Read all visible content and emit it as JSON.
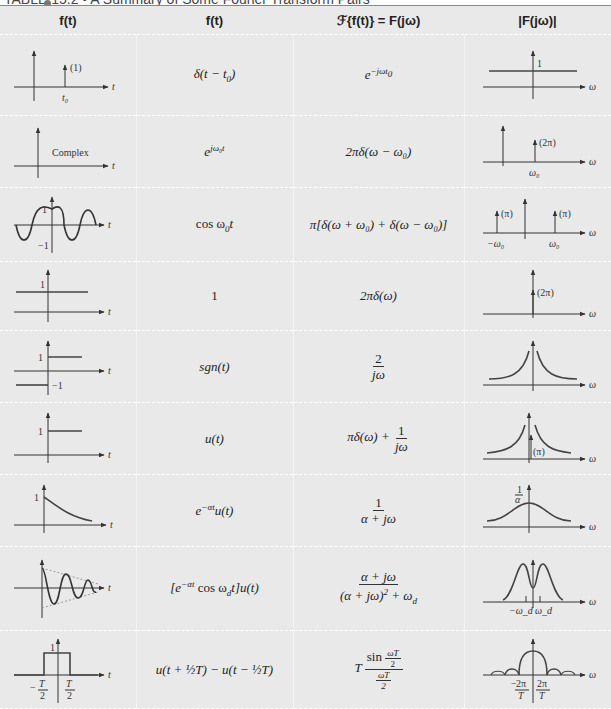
{
  "title": {
    "text": "TABLE 15.2  •  A Summary of Some Fourier Transform Pairs"
  },
  "headers": [
    "f(t)",
    "f(t)",
    "ℱ{f(t)} = F(jω)",
    "|F(jω)|"
  ],
  "rows": [
    {
      "name": "shifted-impulse",
      "ft": "δ(t − t₀)",
      "Fjw": "e^(−jωt₀)",
      "plot_t_labels": [
        "(1)",
        "t₀",
        "t"
      ],
      "plot_w_labels": [
        "1",
        "ω"
      ]
    },
    {
      "name": "complex-exponential",
      "ft": "e^(jω₀t)",
      "Fjw": "2πδ(ω − ω₀)",
      "plot_t_labels": [
        "Complex",
        "t"
      ],
      "plot_w_labels": [
        "(2π)",
        "ω₀",
        "ω"
      ]
    },
    {
      "name": "cosine",
      "ft": "cos ω₀t",
      "Fjw": "π[δ(ω + ω₀) + δ(ω − ω₀)]",
      "plot_t_labels": [
        "1",
        "−1",
        "t"
      ],
      "plot_w_labels": [
        "(π)",
        "(π)",
        "−ω₀",
        "ω₀",
        "ω"
      ]
    },
    {
      "name": "constant",
      "ft": "1",
      "Fjw": "2πδ(ω)",
      "plot_t_labels": [
        "1",
        "t"
      ],
      "plot_w_labels": [
        "(2π)",
        "ω"
      ]
    },
    {
      "name": "signum",
      "ft": "sgn(t)",
      "Fjw_num": "2",
      "Fjw_den": "jω",
      "plot_t_labels": [
        "1",
        "−1",
        "t"
      ],
      "plot_w_labels": [
        "ω"
      ]
    },
    {
      "name": "unit-step",
      "ft": "u(t)",
      "Fjw_prefix": "πδ(ω) +",
      "Fjw_num": "1",
      "Fjw_den": "jω",
      "plot_t_labels": [
        "1",
        "t"
      ],
      "plot_w_labels": [
        "(π)",
        "ω"
      ]
    },
    {
      "name": "decaying-exponential",
      "ft": "e^(−αt)u(t)",
      "Fjw_num": "1",
      "Fjw_den": "α + jω",
      "plot_t_labels": [
        "1",
        "t"
      ],
      "plot_w_labels": [
        "1/α",
        "ω"
      ]
    },
    {
      "name": "damped-cosine",
      "ft": "[e^(−αt) cos ω_d t]u(t)",
      "Fjw_num": "α + jω",
      "Fjw_den": "(α + jω)² + ω_d²",
      "plot_t_labels": [
        "t"
      ],
      "plot_w_labels": [
        "−ω_d",
        "ω_d",
        "ω"
      ]
    },
    {
      "name": "rectangular-pulse",
      "ft": "u(t + ½T) − u(t − ½T)",
      "Fjw_prefix": "T",
      "Fjw_num": "sin(ωT/2)",
      "Fjw_den": "ωT/2",
      "plot_t_labels": [
        "1",
        "−T/2",
        "T/2",
        "t"
      ],
      "plot_w_labels": [
        "−2π/T",
        "2π/T",
        "ω"
      ]
    }
  ],
  "labels": {
    "r0_ft_a": "δ(",
    "r0_ft_b": "t",
    "r0_ft_c": " − ",
    "r0_ft_d": "t",
    "r0_ft_e": "0",
    "r0_ft_f": ")",
    "r0_F_base": "e",
    "r0_F_exp": "−jωt",
    "r0_F_sub": "0",
    "r1_ft_base": "e",
    "r1_ft_exp": "jω₀t",
    "r1_F": "2πδ(ω − ω₀)",
    "r2_ft_a": "cos ω",
    "r2_ft_sub": "0",
    "r2_ft_b": "t",
    "r2_F": "π[δ(ω + ω₀) + δ(ω − ω₀)]",
    "r3_ft": "1",
    "r3_F": "2πδ(ω)",
    "r4_ft": "sgn(t)",
    "r4_num": "2",
    "r4_den": "jω",
    "r5_ft": "u(t)",
    "r5_prefix": "πδ(ω) + ",
    "r5_num": "1",
    "r5_den": "jω",
    "r6_ft_base": "e",
    "r6_ft_exp": "−αt",
    "r6_ft_rest": "u(t)",
    "r6_num": "1",
    "r6_den": "α + jω",
    "r7_ft_a": "[e",
    "r7_ft_exp": "−αt",
    "r7_ft_b": " cos ω",
    "r7_ft_sub": "d",
    "r7_ft_c": "t]u(t)",
    "r7_num": "α + jω",
    "r7_den_a": "(α + jω)",
    "r7_den_sup": "2",
    "r7_den_b": " + ω",
    "r7_den_sub": "d",
    "r8_ft": "u(t + ½T) − u(t − ½T)",
    "r8_prefix": "T",
    "r8_num_a": "sin ",
    "r8_num_frac_n": "ωT",
    "r8_num_frac_d": "2",
    "r8_den_n": "ωT",
    "r8_den_d": "2",
    "p_one": "(1)",
    "p_t0": "t₀",
    "p_t": "t",
    "p_w": "ω",
    "p_1": "1",
    "p_m1": "−1",
    "p_complex": "Complex",
    "p_2pi": "(2π)",
    "p_w0": "ω₀",
    "p_mw0": "−ω₀",
    "p_pi": "(π)",
    "p_1a_n": "1",
    "p_1a_d": "α",
    "p_wd": "ω_d",
    "p_mwd": "−ω_d",
    "p_T2n": "T",
    "p_T2d": "2",
    "p_mT2": "−",
    "p_2piT_n": "2π",
    "p_2piT_d": "T",
    "p_m": "−"
  }
}
